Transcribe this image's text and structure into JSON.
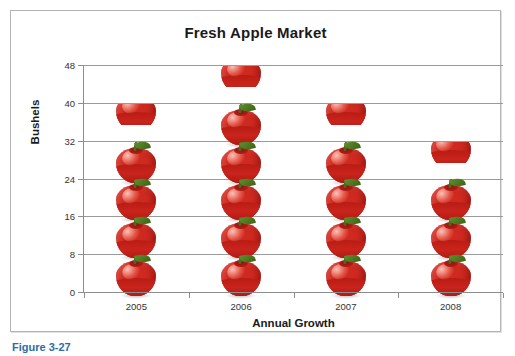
{
  "chart_data": {
    "type": "bar",
    "title": "Fresh Apple Market",
    "xlabel": "Annual Growth",
    "ylabel": "Bushels",
    "categories": [
      "2005",
      "2006",
      "2007",
      "2008"
    ],
    "values": [
      34,
      42,
      34,
      26
    ],
    "ylim": [
      0,
      48
    ],
    "yticks": [
      0,
      8,
      16,
      24,
      32,
      40,
      48
    ],
    "grid": true,
    "legend": "none",
    "style": "pictograph",
    "unit_symbol": "apple-icon",
    "unit_value": 8,
    "series": [
      {
        "name": "Bushels",
        "values": [
          34,
          42,
          34,
          26
        ]
      }
    ],
    "bars": [
      {
        "category": "2005",
        "value": 34,
        "full_icons": 4,
        "partial_icon": 0.25
      },
      {
        "category": "2006",
        "value": 42,
        "full_icons": 5,
        "partial_icon": 0.25
      },
      {
        "category": "2007",
        "value": 34,
        "full_icons": 4,
        "partial_icon": 0.25
      },
      {
        "category": "2008",
        "value": 26,
        "full_icons": 3,
        "partial_icon": 0.25
      }
    ]
  },
  "chart": {
    "title": "Fresh Apple Market",
    "y_axis_title": "Bushels",
    "x_axis_title": "Annual Growth",
    "y_tick_labels": [
      "48",
      "40",
      "32",
      "24",
      "16",
      "8",
      "0"
    ],
    "x_tick_labels": [
      "2005",
      "2006",
      "2007",
      "2008"
    ],
    "colors": {
      "apple_red": "#cf2a20",
      "apple_dark_red": "#b81c14",
      "leaf_green": "#4a6b22",
      "gridline": "#9a9a9a",
      "frame_border": "#b4b4b4",
      "title_text": "#1a1a1a",
      "tick_text": "#333333",
      "caption_blue": "#2e6ca4",
      "background": "#ffffff"
    }
  },
  "caption": {
    "text": "Figure 3-27"
  }
}
